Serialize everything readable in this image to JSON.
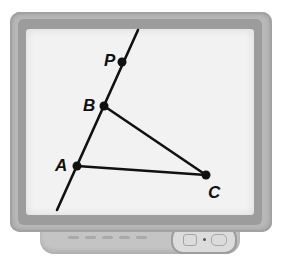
{
  "figure": {
    "points": [
      {
        "id": "P",
        "label": "P",
        "x": 122,
        "y": 62,
        "label_x": 104,
        "label_y": 66
      },
      {
        "id": "B",
        "label": "B",
        "x": 104,
        "y": 106,
        "label_x": 83,
        "label_y": 111
      },
      {
        "id": "A",
        "label": "A",
        "x": 77,
        "y": 166,
        "label_x": 55,
        "label_y": 171
      },
      {
        "id": "C",
        "label": "C",
        "x": 206,
        "y": 175,
        "label_x": 208,
        "label_y": 198
      }
    ],
    "line": {
      "through": [
        "A",
        "B",
        "P"
      ],
      "x1": 57,
      "y1": 210,
      "x2": 138,
      "y2": 30
    },
    "segments": [
      {
        "from": "B",
        "to": "C"
      },
      {
        "from": "A",
        "to": "C"
      }
    ]
  },
  "colors": {
    "screen": "#f2f2f2",
    "bezel": "#b8b8b8",
    "ink": "#111111"
  }
}
